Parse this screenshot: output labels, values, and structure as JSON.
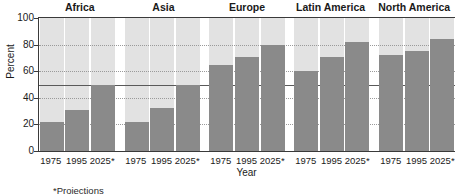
{
  "chart_data": {
    "type": "bar",
    "title": "",
    "xlabel": "Year",
    "ylabel": "Percent",
    "ylim": [
      0,
      100
    ],
    "yticks": [
      0,
      20,
      40,
      60,
      80,
      100
    ],
    "grid": true,
    "legend": false,
    "reference_line": 50,
    "categories": [
      "1975",
      "1995",
      "2025*"
    ],
    "groups": [
      "Africa",
      "Asia",
      "Europe",
      "Latin America",
      "North America"
    ],
    "series": [
      {
        "name": "Africa",
        "values": [
          22,
          31,
          50
        ]
      },
      {
        "name": "Asia",
        "values": [
          22,
          32,
          50
        ]
      },
      {
        "name": "Europe",
        "values": [
          65,
          71,
          80
        ]
      },
      {
        "name": "Latin America",
        "values": [
          60,
          71,
          82
        ]
      },
      {
        "name": "North America",
        "values": [
          72,
          75,
          84
        ]
      }
    ],
    "footnote": "*Projections",
    "colors": {
      "bar": "#8a8a8a",
      "band": "#e2e2e2",
      "axis": "#3a3a3a",
      "gridline": "#9a9a9a",
      "reference_line": "#5a5a5a",
      "background": "#ffffff"
    }
  }
}
